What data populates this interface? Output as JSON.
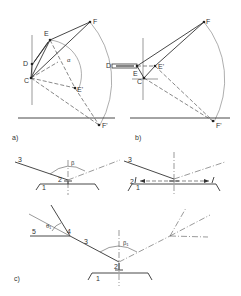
{
  "figure": {
    "panels": {
      "a": {
        "label": "a)",
        "points": [
          "C",
          "D",
          "E",
          "E'",
          "F",
          "F'"
        ],
        "angle": "α"
      },
      "b": {
        "label": "b)",
        "points": [
          "C",
          "D",
          "E",
          "E'",
          "F",
          "F'"
        ]
      },
      "c_top_left": {
        "labels": [
          "1",
          "2",
          "3"
        ],
        "angle": "β"
      },
      "c_top_right": {
        "labels": [
          "1",
          "2",
          "3"
        ]
      },
      "c": {
        "label": "c)",
        "labels": [
          "1",
          "2",
          "3",
          "4",
          "5"
        ],
        "angle_main": "β₁",
        "angle_small": "θ₁"
      }
    }
  }
}
